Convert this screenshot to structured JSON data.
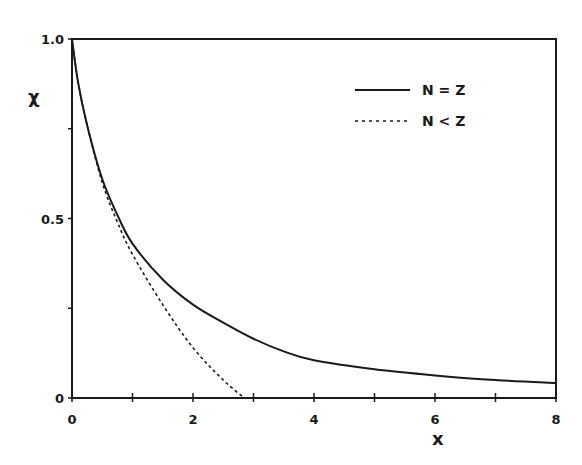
{
  "chart_data": {
    "type": "line",
    "title": "",
    "xlabel": "x",
    "ylabel": "χ",
    "xlim": [
      0,
      8
    ],
    "ylim": [
      0,
      1.0
    ],
    "x_ticks": [
      0,
      2,
      4,
      6,
      8
    ],
    "x_tick_labels": [
      "0",
      "2",
      "4",
      "6",
      "8"
    ],
    "x_minor_ticks": [
      1,
      3,
      5,
      7
    ],
    "y_ticks": [
      0,
      0.5,
      1.0
    ],
    "y_tick_labels": [
      "0",
      "0.5",
      "1.0"
    ],
    "y_minor_ticks": [
      0.25,
      0.75
    ],
    "grid": false,
    "legend_position": "upper right",
    "series": [
      {
        "name": "N = Z",
        "style": "solid",
        "x": [
          0,
          0.1,
          0.25,
          0.5,
          0.75,
          1.0,
          1.5,
          2.0,
          2.5,
          3.0,
          3.5,
          4.0,
          5.0,
          6.0,
          7.0,
          8.0
        ],
        "y": [
          1.0,
          0.88,
          0.76,
          0.61,
          0.51,
          0.43,
          0.33,
          0.26,
          0.21,
          0.165,
          0.13,
          0.105,
          0.08,
          0.063,
          0.05,
          0.042
        ]
      },
      {
        "name": "N < Z",
        "style": "dashed",
        "x": [
          0,
          0.1,
          0.25,
          0.5,
          0.75,
          1.0,
          1.5,
          2.0,
          2.5,
          2.85
        ],
        "y": [
          1.0,
          0.88,
          0.76,
          0.6,
          0.49,
          0.4,
          0.26,
          0.14,
          0.05,
          0.0
        ]
      }
    ]
  },
  "legend": {
    "items": [
      {
        "label": "N = Z",
        "style": "solid"
      },
      {
        "label": "N < Z",
        "style": "dashed"
      }
    ]
  },
  "axes": {
    "x_title": "x",
    "y_title": "χ"
  },
  "colors": {
    "line": "#1a1a1a",
    "background": "#ffffff"
  }
}
